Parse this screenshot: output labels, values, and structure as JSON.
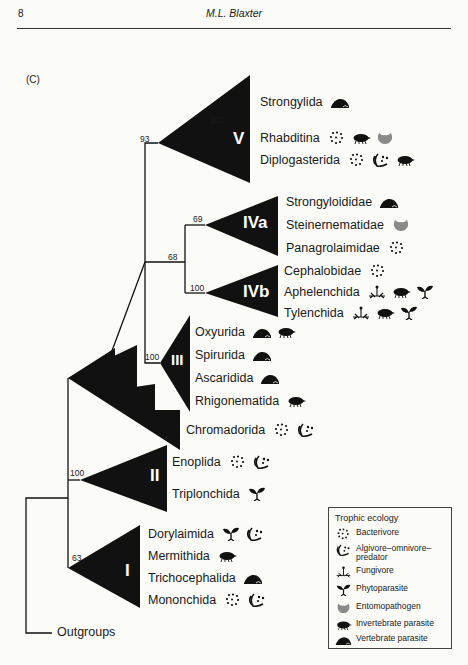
{
  "header": {
    "page_number": "8",
    "author": "M.L. Blaxter"
  },
  "figure": {
    "panel_label": "(C)",
    "clades": [
      {
        "id": "V",
        "support": "93",
        "inner_support": "100",
        "taxa": [
          {
            "name": "Strongylida",
            "ecology": [
              "vertebrate-parasite"
            ]
          },
          {
            "name": "Rhabditina",
            "ecology": [
              "bacterivore",
              "invertebrate-parasite",
              "entomopathogen"
            ]
          },
          {
            "name": "Diplogasterida",
            "ecology": [
              "bacterivore",
              "algivore-omnivore-predator",
              "invertebrate-parasite"
            ]
          }
        ]
      },
      {
        "id": "IVa",
        "support": "69",
        "taxa": [
          {
            "name": "Strongyloididae",
            "ecology": [
              "vertebrate-parasite"
            ]
          },
          {
            "name": "Steinernematidae",
            "ecology": [
              "entomopathogen"
            ]
          },
          {
            "name": "Panagrolaimidae",
            "ecology": [
              "bacterivore"
            ]
          }
        ]
      },
      {
        "id": "IVb",
        "support": "100",
        "taxa": [
          {
            "name": "Cephalobidae",
            "ecology": [
              "bacterivore"
            ]
          },
          {
            "name": "Aphelenchida",
            "ecology": [
              "fungivore",
              "invertebrate-parasite",
              "phytoparasite"
            ]
          },
          {
            "name": "Tylenchida",
            "ecology": [
              "fungivore",
              "invertebrate-parasite",
              "phytoparasite"
            ]
          }
        ]
      },
      {
        "id": "IV",
        "support": "68"
      },
      {
        "id": "III",
        "support": "100",
        "taxa": [
          {
            "name": "Oxyurida",
            "ecology": [
              "vertebrate-parasite",
              "invertebrate-parasite"
            ]
          },
          {
            "name": "Spirurida",
            "ecology": [
              "vertebrate-parasite"
            ]
          },
          {
            "name": "Ascaridida",
            "ecology": [
              "vertebrate-parasite"
            ]
          },
          {
            "name": "Rhigonematida",
            "ecology": [
              "invertebrate-parasite"
            ]
          }
        ]
      },
      {
        "id": "Chromadorida-group",
        "taxa": [
          {
            "name": "Chromadorida",
            "ecology": [
              "bacterivore",
              "algivore-omnivore-predator"
            ]
          }
        ]
      },
      {
        "id": "II",
        "support": "100",
        "taxa": [
          {
            "name": "Enoplida",
            "ecology": [
              "bacterivore",
              "algivore-omnivore-predator"
            ]
          },
          {
            "name": "Triplonchida",
            "ecology": [
              "phytoparasite"
            ]
          }
        ]
      },
      {
        "id": "I",
        "support": "63",
        "taxa": [
          {
            "name": "Dorylaimida",
            "ecology": [
              "phytoparasite",
              "algivore-omnivore-predator"
            ]
          },
          {
            "name": "Mermithida",
            "ecology": [
              "invertebrate-parasite"
            ]
          },
          {
            "name": "Trichocephalida",
            "ecology": [
              "vertebrate-parasite"
            ]
          },
          {
            "name": "Mononchida",
            "ecology": [
              "bacterivore",
              "algivore-omnivore-predator"
            ]
          }
        ]
      }
    ],
    "outgroup": "Outgroups",
    "legend": {
      "title": "Trophic ecology",
      "items": [
        {
          "icon": "bacterivore",
          "label": "Bacterivore"
        },
        {
          "icon": "algivore-omnivore-predator",
          "label": "Algivore–omnivore–predator"
        },
        {
          "icon": "fungivore",
          "label": "Fungivore"
        },
        {
          "icon": "phytoparasite",
          "label": "Phytoparasite"
        },
        {
          "icon": "entomopathogen",
          "label": "Entomopathogen"
        },
        {
          "icon": "invertebrate-parasite",
          "label": "Invertebrate parasite"
        },
        {
          "icon": "vertebrate-parasite",
          "label": "Vertebrate parasite"
        }
      ]
    },
    "colors": {
      "clade_fill": "#111111",
      "entomopathogen": "#8a8a8a",
      "line": "#111111"
    }
  }
}
